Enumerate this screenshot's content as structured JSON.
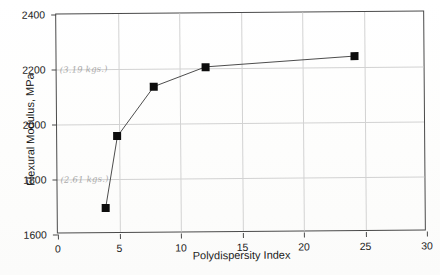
{
  "chart_data": {
    "type": "line",
    "title": "",
    "subtitle": "",
    "xlabel": "Polydispersity Index",
    "ylabel": "Flexural Modulus, MPa",
    "xlim": [
      0,
      30
    ],
    "ylim": [
      1600,
      2400
    ],
    "xticks": [
      0,
      5,
      10,
      15,
      20,
      25,
      30
    ],
    "yticks": [
      1600,
      1800,
      2000,
      2200,
      2400
    ],
    "grid": true,
    "legend": null,
    "legend_position": "none",
    "marker": "filled-square",
    "series": [
      {
        "name": "Flexural Modulus vs Polydispersity Index",
        "x": [
          3.9,
          4.9,
          7.9,
          12.1,
          24.2
        ],
        "values": [
          1695,
          1955,
          2135,
          2205,
          2240
        ]
      }
    ],
    "points": [
      {
        "x": 3.9,
        "y": 1695
      },
      {
        "x": 4.9,
        "y": 1955
      },
      {
        "x": 7.9,
        "y": 2135
      },
      {
        "x": 12.1,
        "y": 2205
      },
      {
        "x": 24.2,
        "y": 2240
      }
    ],
    "annotations": [
      {
        "text": "(3.19 kgs.)",
        "x_value": 0.0,
        "y_value": 2200,
        "style": "handwritten"
      },
      {
        "text": "(2.61 kgs.)",
        "x_value": 0.0,
        "y_value": 1800,
        "style": "handwritten"
      }
    ],
    "colors": {
      "marker": "#0d0d0d",
      "line": "#3a3a3a",
      "grid": "#d2d2d2",
      "axis": "#4a4a4a",
      "annotation": "#9a9a9a",
      "background": "#ffffff"
    }
  },
  "axes": {
    "x_tick_labels": [
      "0",
      "5",
      "10",
      "15",
      "20",
      "25",
      "30"
    ],
    "y_tick_labels": [
      "1600",
      "1800",
      "2000",
      "2200",
      "2400"
    ]
  }
}
